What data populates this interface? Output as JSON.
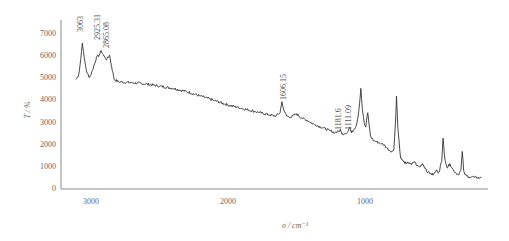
{
  "chart_data": {
    "type": "line",
    "title": "",
    "xlabel": "σ / cm⁻¹",
    "ylabel": "T / %",
    "xlim": [
      3130,
      145
    ],
    "x_reversed": true,
    "ylim": [
      0,
      7000
    ],
    "grid": false,
    "legend": null,
    "x_ticks": [
      3000,
      2000,
      1000
    ],
    "x_tick_labels": [
      "3000",
      "2000",
      "1000"
    ],
    "y_ticks": [
      0,
      1000,
      2000,
      3000,
      4000,
      5000,
      6000,
      7000
    ],
    "y_tick_labels": [
      "0",
      "1000",
      "2000",
      "3000",
      "4000",
      "5000",
      "6000",
      "7000"
    ],
    "annotations": [
      {
        "label": "3063",
        "x": 3063
      },
      {
        "label": "2925.31",
        "x": 2925.31
      },
      {
        "label": "2865.08",
        "x": 2865.08
      },
      {
        "label": "1606.15",
        "x": 1606.15
      },
      {
        "label": "1181.6",
        "x": 1181.6
      },
      {
        "label": "1111.09",
        "x": 1111.09
      }
    ],
    "series": [
      {
        "name": "spectrum",
        "color": "#333333",
        "x": [
          3110,
          3090,
          3075,
          3063,
          3050,
          3030,
          3010,
          2990,
          2960,
          2940,
          2925,
          2905,
          2885,
          2865,
          2850,
          2830,
          2800,
          2700,
          2600,
          2500,
          2400,
          2300,
          2200,
          2100,
          2000,
          1900,
          1800,
          1700,
          1650,
          1620,
          1606,
          1590,
          1570,
          1540,
          1500,
          1460,
          1420,
          1380,
          1340,
          1300,
          1260,
          1220,
          1190,
          1181,
          1170,
          1150,
          1125,
          1111,
          1100,
          1080,
          1060,
          1045,
          1030,
          1020,
          1005,
          995,
          980,
          960,
          940,
          920,
          900,
          880,
          860,
          840,
          820,
          800,
          790,
          778,
          770,
          760,
          740,
          720,
          700,
          680,
          660,
          640,
          620,
          600,
          580,
          560,
          540,
          520,
          500,
          480,
          460,
          450,
          440,
          430,
          420,
          400,
          380,
          360,
          340,
          320,
          300,
          290,
          280,
          270,
          260,
          240,
          220,
          200,
          180,
          160,
          150
        ],
        "values": [
          4900,
          5100,
          5800,
          6550,
          5900,
          5200,
          5000,
          5300,
          5900,
          6000,
          6200,
          5950,
          5800,
          6000,
          5500,
          4900,
          4800,
          4750,
          4700,
          4600,
          4500,
          4350,
          4150,
          3950,
          3750,
          3600,
          3450,
          3300,
          3250,
          3400,
          3900,
          3450,
          3250,
          3200,
          3350,
          3150,
          3050,
          2900,
          2800,
          2700,
          2600,
          2500,
          2550,
          2650,
          2450,
          2450,
          2550,
          2750,
          2500,
          2650,
          2900,
          3500,
          4500,
          3600,
          2900,
          2750,
          3400,
          2350,
          2150,
          2100,
          2050,
          2000,
          1950,
          1800,
          1700,
          1650,
          1700,
          2900,
          4150,
          2700,
          1350,
          1200,
          1100,
          1150,
          1050,
          1200,
          1000,
          950,
          1100,
          900,
          700,
          650,
          600,
          800,
          700,
          1000,
          1200,
          2250,
          1450,
          900,
          1100,
          850,
          700,
          600,
          800,
          1650,
          800,
          600,
          550,
          500,
          500,
          480,
          470,
          460,
          450
        ]
      }
    ]
  },
  "plot_area": {
    "axis_color": "#8a8a8a",
    "line_color": "#333333",
    "px": {
      "x0": 73,
      "x1": 482,
      "y_top": 33,
      "y_bottom": 188
    }
  }
}
